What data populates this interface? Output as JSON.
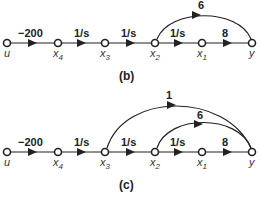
{
  "diagrams": [
    {
      "caption": "(b)",
      "nodes": [
        {
          "id": "u",
          "label": "u",
          "sub": ""
        },
        {
          "id": "x4",
          "label": "x",
          "sub": "4"
        },
        {
          "id": "x3",
          "label": "x",
          "sub": "3"
        },
        {
          "id": "x2",
          "label": "x",
          "sub": "2"
        },
        {
          "id": "x1",
          "label": "x",
          "sub": "1"
        },
        {
          "id": "y",
          "label": "y",
          "sub": ""
        }
      ],
      "branches": [
        {
          "from": "u",
          "to": "x4",
          "gain": "−200"
        },
        {
          "from": "x4",
          "to": "x3",
          "gain": "1/s"
        },
        {
          "from": "x3",
          "to": "x2",
          "gain": "1/s"
        },
        {
          "from": "x2",
          "to": "x1",
          "gain": "1/s"
        },
        {
          "from": "x1",
          "to": "y",
          "gain": "8"
        },
        {
          "from": "x2",
          "to": "y",
          "gain": "6"
        }
      ]
    },
    {
      "caption": "(c)",
      "nodes": [
        {
          "id": "u",
          "label": "u",
          "sub": ""
        },
        {
          "id": "x4",
          "label": "x",
          "sub": "4"
        },
        {
          "id": "x3",
          "label": "x",
          "sub": "3"
        },
        {
          "id": "x2",
          "label": "x",
          "sub": "2"
        },
        {
          "id": "x1",
          "label": "x",
          "sub": "1"
        },
        {
          "id": "y",
          "label": "y",
          "sub": ""
        }
      ],
      "branches": [
        {
          "from": "u",
          "to": "x4",
          "gain": "−200"
        },
        {
          "from": "x4",
          "to": "x3",
          "gain": "1/s"
        },
        {
          "from": "x3",
          "to": "x2",
          "gain": "1/s"
        },
        {
          "from": "x2",
          "to": "x1",
          "gain": "1/s"
        },
        {
          "from": "x1",
          "to": "y",
          "gain": "8"
        },
        {
          "from": "x2",
          "to": "y",
          "gain": "6"
        },
        {
          "from": "x3",
          "to": "y",
          "gain": "1"
        }
      ]
    }
  ]
}
